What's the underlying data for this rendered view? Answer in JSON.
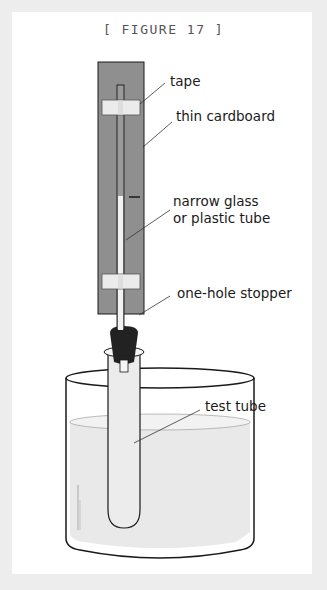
{
  "figure": {
    "title": "[ FIGURE 17 ]",
    "labels": {
      "tape": "tape",
      "cardboard": "thin cardboard",
      "tube_line1": "narrow glass",
      "tube_line2": "or plastic tube",
      "stopper": "one-hole stopper",
      "test_tube": "test tube"
    },
    "colors": {
      "cardboard": "#8f8f8f",
      "tape": "#ebebeb",
      "stopper": "#222222",
      "water": "#e6e6e6",
      "outline": "#1a1a1a",
      "background": "#ededed"
    }
  }
}
